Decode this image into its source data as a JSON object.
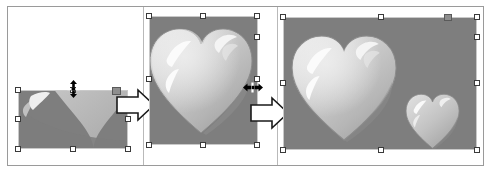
{
  "figure": {
    "background_color": "#ffffff",
    "frame_color": "#9a9a9a",
    "panel_background": "#7e7e7e",
    "heart_color": "#b9b9b9",
    "highlight_color": "#f2f2f2",
    "handle_fill": "#ffffff",
    "handle_border": "#3a3a3a",
    "active_handle_fill": "#8e8e8e"
  },
  "panels": [
    {
      "id": "panel-1",
      "label": "Compressed image selection",
      "image_alt": "Heart clip art squashed vertically, only lower portion visible",
      "selected": true,
      "cursor": "vertical-resize-cursor",
      "handle_count": 8,
      "active_handle": "top-right"
    },
    {
      "id": "panel-2",
      "label": "Restored proportion selection",
      "image_alt": "Large glossy heart on gray background, full height",
      "selected": true,
      "cursor": "horizontal-resize-cursor",
      "handle_count": 8,
      "active_handle": "none"
    },
    {
      "id": "panel-3",
      "label": "Enlarged canvas selection",
      "image_alt": "Large glossy heart with a second smaller heart on gray background",
      "selected": true,
      "cursor": "none",
      "handle_count": 8,
      "active_handle": "top-right"
    }
  ],
  "arrows": [
    {
      "id": "arrow-1",
      "label": "Transition arrow one",
      "direction": "right"
    },
    {
      "id": "arrow-2",
      "label": "Transition arrow two",
      "direction": "right"
    }
  ],
  "cursors": [
    {
      "id": "vertical-resize-cursor",
      "icon": "resize-vertical-icon",
      "label": "Vertical resize pointer"
    },
    {
      "id": "horizontal-resize-cursor",
      "icon": "resize-horizontal-icon",
      "label": "Horizontal resize pointer"
    }
  ]
}
